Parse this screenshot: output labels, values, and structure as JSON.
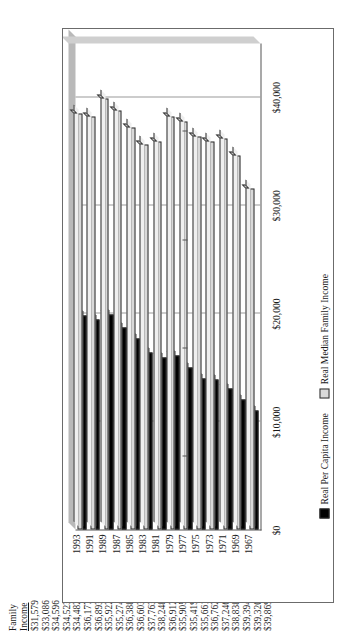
{
  "table": {
    "header_line1": "Family",
    "header_line2": "Income",
    "values": [
      "$31,579",
      "$33,086",
      "$34,596",
      "$34,523",
      "$34,482",
      "$36,177",
      "$36,893",
      "$35,922",
      "$35,274",
      "$36,388",
      "$36,603",
      "$37,763",
      "$38,248",
      "$36,912",
      "$35,905",
      "$35,419",
      "$35,661",
      "$36,762",
      "$37,246",
      "$38,838",
      "$39,394",
      "$39,320",
      "$39,869"
    ]
  },
  "chart_data": {
    "type": "bar",
    "orientation": "horizontal",
    "title": "",
    "xlabel": "",
    "ylabel": "",
    "grid": true,
    "legend_position": "bottom",
    "axis_tick_labels": [
      "$0",
      "$10,000",
      "$20,000",
      "$30,000",
      "$40,000"
    ],
    "xlim": [
      0,
      45000
    ],
    "categories": [
      "1967",
      "1969",
      "1971",
      "1973",
      "1975",
      "1977",
      "1979",
      "1981",
      "1983",
      "1985",
      "1987",
      "1989",
      "1991",
      "1993"
    ],
    "series": [
      {
        "name": "Real Per Capita Income",
        "key": "dark",
        "values": [
          11000,
          12000,
          13100,
          13900,
          14000,
          15000,
          16100,
          15900,
          16400,
          17700,
          18700,
          19900,
          19400,
          19800
        ]
      },
      {
        "name": "Real Median Family Income",
        "key": "light",
        "values": [
          31579,
          34596,
          36177,
          35922,
          36388,
          37763,
          38248,
          35905,
          35661,
          37246,
          38838,
          39869,
          38200,
          38500
        ]
      }
    ]
  }
}
